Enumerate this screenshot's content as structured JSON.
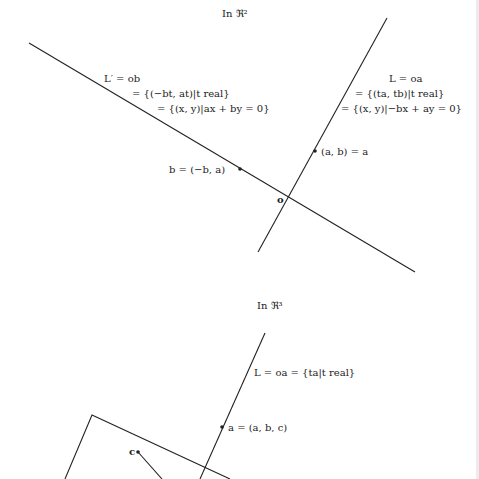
{
  "top_diagram": {
    "title": "In ℜ²",
    "line_L_prime": {
      "line1": "L′ = ob",
      "line2": "= {(−bt, at)|t real}",
      "line3": "= {(x, y)|ax + by = 0}"
    },
    "line_L": {
      "line1": "L = oa",
      "line2": "= {(ta, tb)|t real}",
      "line3": "= {(x, y)|−bx + ay = 0}"
    },
    "point_a_label": "(a, b) = a",
    "point_b_label": "b = (−b, a)",
    "origin_label": "o"
  },
  "bottom_diagram": {
    "title": "In ℜ³",
    "line_L_label": "L = oa = {ta|t real}",
    "point_a_label": "a = (a, b, c)",
    "point_c_label": "c"
  },
  "colors": {
    "ink": "#222222",
    "background": "#ffffff",
    "edge_strip": "#ececec"
  }
}
